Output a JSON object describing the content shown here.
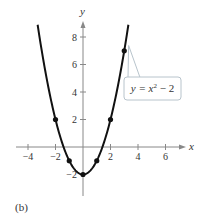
{
  "chart_data": {
    "type": "line",
    "title": "",
    "caption": "(b)",
    "xlabel": "x",
    "ylabel": "y",
    "xlim": [
      -5,
      7.5
    ],
    "ylim": [
      -3.5,
      9
    ],
    "x_ticks": [
      -4,
      -2,
      2,
      4,
      6
    ],
    "y_ticks": [
      -2,
      2,
      4,
      6,
      8
    ],
    "grid": false,
    "series": [
      {
        "name": "y = x^2 - 2",
        "equation": "y = x² − 2",
        "curve_x_range": [
          -3.3,
          3.3
        ],
        "points": [
          {
            "x": -2,
            "y": 2
          },
          {
            "x": -1,
            "y": -1
          },
          {
            "x": 0,
            "y": -2
          },
          {
            "x": 1,
            "y": -1
          },
          {
            "x": 2,
            "y": 2
          },
          {
            "x": 3,
            "y": 7
          }
        ]
      }
    ],
    "annotations": [
      {
        "text": "y = x² − 2",
        "points_to": {
          "x": 3.1,
          "y": 7.6
        }
      }
    ]
  },
  "labels": {
    "x_axis": "x",
    "y_axis": "y",
    "caption": "(b)",
    "callout": "y = x² − 2"
  },
  "colors": {
    "axis": "#888888",
    "curve": "#111111",
    "callout_border": "#b8c4cc",
    "callout_fill": "#ffffff"
  }
}
